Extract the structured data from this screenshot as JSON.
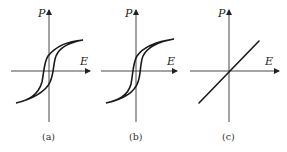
{
  "figure": {
    "panels": [
      {
        "id": "a",
        "caption": "(a)",
        "x_label": "E",
        "y_label": "P",
        "curve": "wide hysteresis loop"
      },
      {
        "id": "b",
        "caption": "(b)",
        "x_label": "E",
        "y_label": "P",
        "curve": "narrow hysteresis loop"
      },
      {
        "id": "c",
        "caption": "(c)",
        "x_label": "E",
        "y_label": "P",
        "curve": "linear"
      }
    ],
    "colors": {
      "line": "#1a1a1a",
      "axis": "#333333",
      "background": "#ffffff"
    }
  }
}
